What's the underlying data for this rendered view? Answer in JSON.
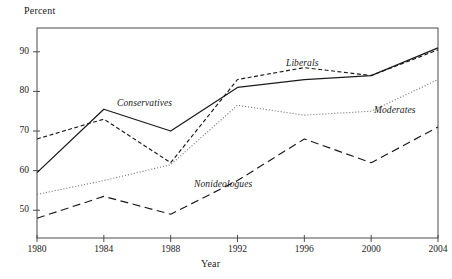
{
  "chart_data": {
    "type": "line",
    "title": "",
    "xlabel": "Year",
    "ylabel": "Percent",
    "x": [
      1980,
      1984,
      1988,
      1992,
      1996,
      2000,
      2004
    ],
    "xticklabels": [
      "1980",
      "1984",
      "1988",
      "1992",
      "1996",
      "2000",
      "2004"
    ],
    "yticklabels": [
      "50",
      "60",
      "70",
      "80",
      "90"
    ],
    "yticks": [
      50,
      60,
      70,
      80,
      90
    ],
    "xlim": [
      1980,
      2004
    ],
    "ylim": [
      43,
      96
    ],
    "grid": false,
    "legend_position": "inline-annotations",
    "series": [
      {
        "name": "Conservatives",
        "style": "solid",
        "color": "#1a1a1a",
        "values": [
          59.5,
          75.5,
          70.0,
          81.0,
          83.0,
          84.0,
          91.0
        ]
      },
      {
        "name": "Liberals",
        "style": "short-dash",
        "color": "#1a1a1a",
        "values": [
          68.0,
          73.0,
          62.0,
          83.0,
          86.0,
          84.0,
          90.5
        ]
      },
      {
        "name": "Moderates",
        "style": "dotted",
        "color": "#6e6e6e",
        "values": [
          54.0,
          57.5,
          61.5,
          76.5,
          74.0,
          75.0,
          83.0
        ]
      },
      {
        "name": "Nonideologues",
        "style": "long-dash",
        "color": "#1a1a1a",
        "values": [
          48.0,
          53.5,
          49.0,
          57.5,
          68.0,
          62.0,
          71.0
        ]
      }
    ],
    "annotations": [
      {
        "text": "Conservatives",
        "x_px": 117,
        "y_px": 98
      },
      {
        "text": "Liberals",
        "x_px": 286,
        "y_px": 58
      },
      {
        "text": "Moderates",
        "x_px": 374,
        "y_px": 105
      },
      {
        "text": "Nonideologues",
        "x_px": 194,
        "y_px": 179
      }
    ]
  },
  "axes": {
    "y_title": "Percent",
    "x_title": "Year"
  }
}
